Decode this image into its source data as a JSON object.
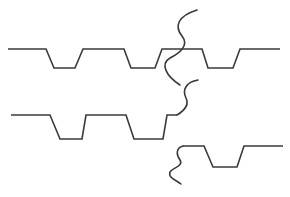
{
  "diagram": {
    "type": "trapezoidal-waveform-with-break-marks",
    "stroke_color": "#3a3a3a",
    "background": "#ffffff",
    "rows": [
      {
        "name": "row-1",
        "points": "8,49 46,49 54,68 75,68 83,49 124,49 131,68 155,68 162,49 202,49 208,68 233,68 240,49 280,49"
      },
      {
        "name": "row-2",
        "points": "11,115 50,115 60,139 82,139 86,115 126,115 134,139 163,139 167,115 177,115"
      },
      {
        "name": "row-3",
        "points": "183,146 204,146 213,167 237,167 244,146 283,146"
      }
    ],
    "breaks": [
      {
        "name": "break-mark-1",
        "d": "M197,10 C178,16 174,26 182,36 C190,46 178,54 170,58 C160,64 166,76 180,85"
      },
      {
        "name": "break-mark-2",
        "d": "M198,80 C186,82 182,90 186,98 C190,106 182,112 177,115"
      },
      {
        "name": "break-mark-3",
        "d": "M183,146 C176,148 176,154 180,160 C184,166 172,168 170,172 C168,178 176,180 181,184"
      }
    ]
  }
}
